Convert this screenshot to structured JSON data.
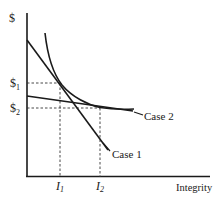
{
  "diagram": {
    "axes": {
      "y_label": "$",
      "x_label": "Integrity"
    },
    "y_ticks": [
      {
        "base": "$",
        "sub": "1"
      },
      {
        "base": "$",
        "sub": "2"
      }
    ],
    "x_ticks": [
      {
        "base": "I",
        "sub": "1"
      },
      {
        "base": "I",
        "sub": "2"
      }
    ],
    "curves": {
      "case1_label": "Case 1",
      "case2_label": "Case 2"
    },
    "colors": {
      "line": "#1a1a1a",
      "dashed": "#333333",
      "background": "#ffffff"
    }
  }
}
